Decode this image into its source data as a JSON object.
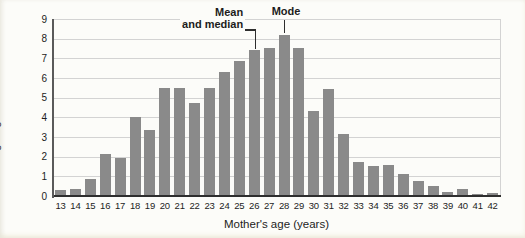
{
  "figure": {
    "background": "#fcfcf9",
    "bar_color": "#8a8a8a",
    "grid_color": "#d3d3d3",
    "xaxis_color": "#2e2e2e",
    "yaxis_color": "#5a5a5a",
    "text_color": "#1c1c1c"
  },
  "chart_data": {
    "type": "bar",
    "title": "",
    "xlabel": "Mother's age (years)",
    "ylabel": "Percent giving birth for the first time",
    "categories": [
      13,
      14,
      15,
      16,
      17,
      18,
      19,
      20,
      21,
      22,
      23,
      24,
      25,
      26,
      27,
      28,
      29,
      30,
      31,
      32,
      33,
      34,
      35,
      36,
      37,
      38,
      39,
      40,
      41,
      42
    ],
    "values": [
      0.3,
      0.35,
      0.85,
      2.15,
      1.95,
      4.0,
      3.35,
      5.5,
      5.5,
      4.75,
      5.5,
      6.3,
      6.85,
      7.4,
      7.55,
      8.2,
      7.55,
      4.3,
      5.45,
      3.15,
      1.75,
      1.55,
      1.6,
      1.1,
      0.75,
      0.5,
      0.2,
      0.35,
      0.1,
      0.15
    ],
    "ylim": [
      0,
      9
    ],
    "ytick_step": 1,
    "grid": true,
    "legend_position": "none",
    "annotations": [
      {
        "line1": "Mean",
        "line2": "and median",
        "target_age": 26
      },
      {
        "line1": "Mode",
        "line2": "",
        "target_age": 28
      }
    ]
  }
}
